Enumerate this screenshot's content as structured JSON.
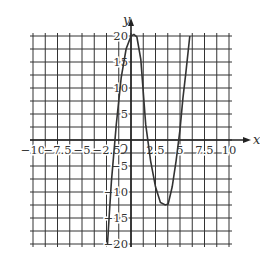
{
  "chart_data": {
    "type": "line",
    "title": "",
    "xlabel": "x",
    "ylabel": "y",
    "origin_label": "O",
    "xlim": [
      -10,
      10
    ],
    "ylim": [
      -20,
      20
    ],
    "grid": true,
    "x_grid_step": 1.25,
    "y_grid_step": 2.5,
    "x_ticks": [
      -10,
      -7.5,
      -5,
      -2.5,
      2.5,
      5,
      7.5,
      10
    ],
    "x_tick_labels": [
      "−10",
      "−7.5",
      "−5",
      "−2.5",
      "2.5",
      "5",
      "7.5",
      "10"
    ],
    "y_ticks": [
      20,
      15,
      10,
      5,
      -5,
      -10,
      -15,
      -20
    ],
    "y_tick_labels": [
      "20",
      "15",
      "10",
      "5",
      "−5",
      "−10",
      "−15",
      "−20"
    ],
    "series": [
      {
        "name": "curve",
        "x": [
          -2.4,
          -2.2,
          -2.0,
          -1.5,
          -1.0,
          -0.5,
          0.0,
          0.3,
          0.6,
          1.0,
          1.5,
          2.0,
          2.5,
          3.0,
          3.5,
          3.8,
          4.2,
          4.6,
          5.0,
          5.3,
          5.6,
          6.0
        ],
        "y": [
          -20,
          -14,
          -8,
          3,
          12,
          17.5,
          20,
          20.3,
          19.8,
          15.5,
          3,
          -4,
          -9,
          -12,
          -12.5,
          -12.3,
          -9,
          -4,
          2,
          8,
          13,
          20
        ]
      }
    ],
    "key_points": {
      "local_max": [
        0.3,
        20.3
      ],
      "local_min": [
        3.6,
        -12.5
      ],
      "x_intercepts": [
        -2.2,
        1.5,
        4.9
      ]
    }
  }
}
